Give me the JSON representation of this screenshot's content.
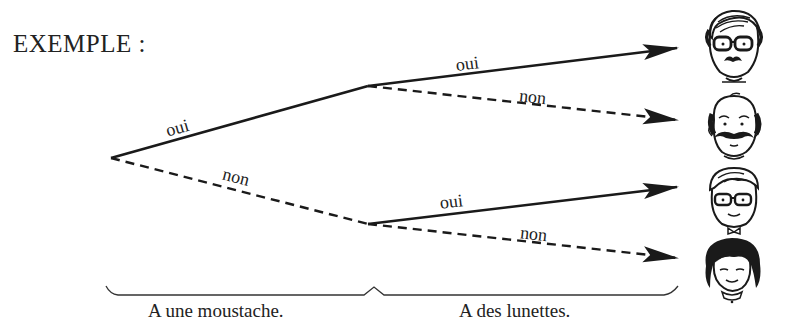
{
  "title": "EXEMPLE :",
  "tree": {
    "root": {
      "x": 111,
      "y": 158
    },
    "levels": [
      {
        "label": "A une moustache.",
        "nodes": [
          "oui",
          "non"
        ]
      },
      {
        "label": "A des lunettes.",
        "nodes": [
          "oui",
          "non",
          "oui",
          "non"
        ]
      }
    ],
    "edges": [
      {
        "id": "root-oui",
        "from": [
          111,
          158
        ],
        "to": [
          368,
          86
        ],
        "label": "oui",
        "style": "solid"
      },
      {
        "id": "root-non",
        "from": [
          111,
          158
        ],
        "to": [
          368,
          224
        ],
        "label": "non",
        "style": "dashed"
      },
      {
        "id": "moustache-oui-lunettes-oui",
        "from": [
          368,
          86
        ],
        "to": [
          677,
          48
        ],
        "label": "oui",
        "style": "solid",
        "arrow": true
      },
      {
        "id": "moustache-oui-lunettes-non",
        "from": [
          368,
          86
        ],
        "to": [
          677,
          120
        ],
        "label": "non",
        "style": "dashed",
        "arrow": true
      },
      {
        "id": "moustache-non-lunettes-oui",
        "from": [
          368,
          224
        ],
        "to": [
          677,
          187
        ],
        "label": "oui",
        "style": "solid",
        "arrow": true
      },
      {
        "id": "moustache-non-lunettes-non",
        "from": [
          368,
          224
        ],
        "to": [
          677,
          258
        ],
        "label": "non",
        "style": "dashed",
        "arrow": true
      }
    ]
  },
  "labels": {
    "e1": "oui",
    "e2": "non",
    "e3": "oui",
    "e4": "non",
    "e5": "oui",
    "e6": "non"
  },
  "braces": {
    "left": "A une moustache.",
    "right": "A des lunettes."
  },
  "faces": [
    {
      "id": "face-man-mustache-glasses",
      "description": "man with mustache and glasses",
      "moustache": true,
      "lunettes": true
    },
    {
      "id": "face-bald-man-mustache",
      "description": "balding man with mustache, no glasses",
      "moustache": true,
      "lunettes": false
    },
    {
      "id": "face-boy-glasses",
      "description": "boy with glasses, no mustache",
      "moustache": false,
      "lunettes": true
    },
    {
      "id": "face-girl",
      "description": "girl with dark bob hair, no glasses, no mustache",
      "moustache": false,
      "lunettes": false
    }
  ],
  "colors": {
    "ink": "#1a1a1a",
    "background": "#ffffff"
  }
}
